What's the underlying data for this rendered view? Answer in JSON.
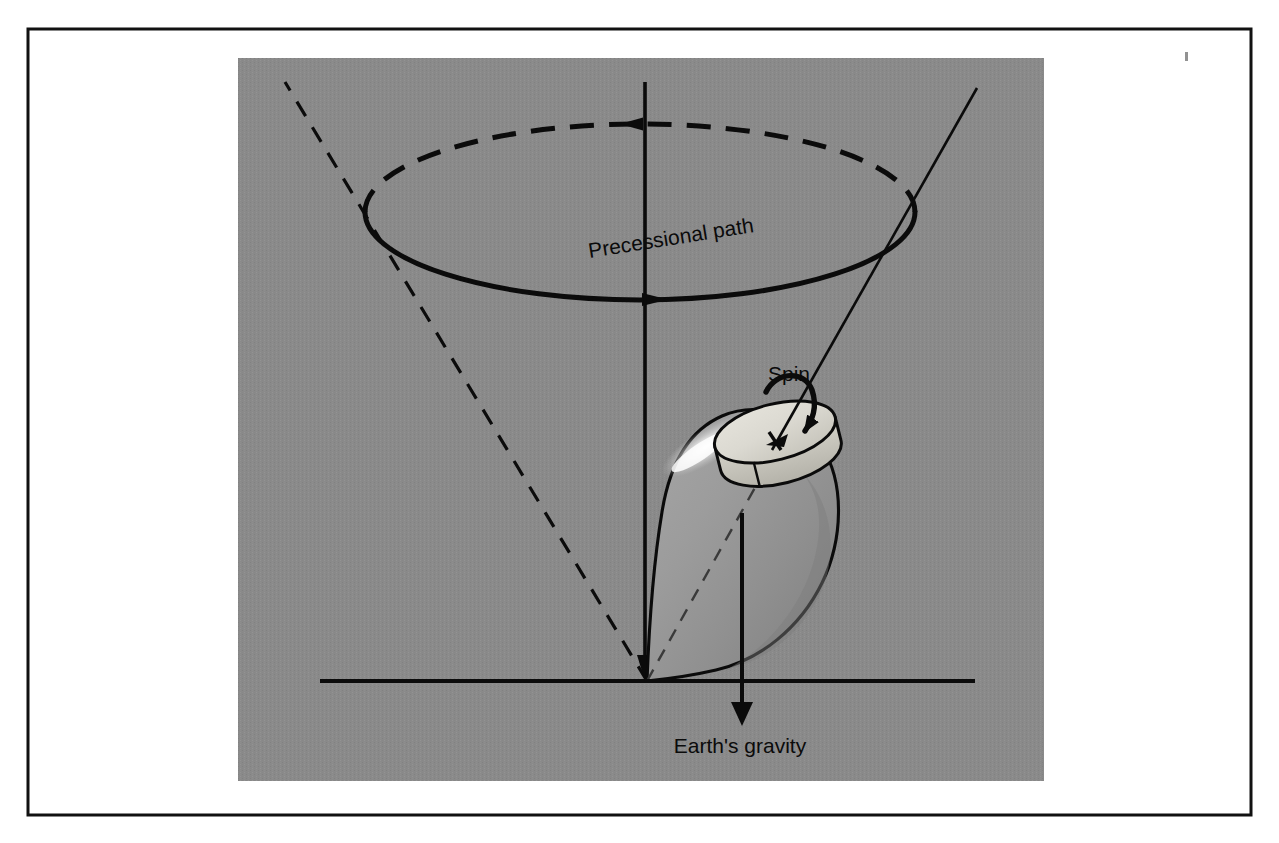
{
  "figure": {
    "domain": "Diagram",
    "background_color": "#ffffff",
    "panel_color": "#8a8a8a",
    "panel_texture_color": "#828282",
    "frame_color": "#111111",
    "ink_color": "#0b0b0b",
    "top_body_color": "#9a9a9a",
    "top_body_shadow_color": "#7f7f7f",
    "top_highlight_color": "#f2f2f2",
    "disk_face_color": "#d9d7cf",
    "disk_rim_color": "#c3c1b8"
  },
  "frame": {
    "x": 28,
    "y": 29,
    "width": 1223,
    "height": 786,
    "stroke_width": 3
  },
  "panel": {
    "x": 238,
    "y": 58,
    "width": 806,
    "height": 723
  },
  "labels": [
    {
      "name": "precessional-path-label",
      "text": "Precessional path",
      "x": 672,
      "y": 245,
      "font_size": 21,
      "rotation": -9,
      "anchor": "middle"
    },
    {
      "name": "spin-label",
      "text": "Spin",
      "x": 789,
      "y": 381,
      "font_size": 21,
      "rotation": 0,
      "anchor": "middle"
    },
    {
      "name": "earths-gravity-label",
      "text": "Earth's gravity",
      "x": 740,
      "y": 753,
      "font_size": 21,
      "rotation": 0,
      "anchor": "middle"
    }
  ],
  "geometry": {
    "pivot": {
      "x": 647,
      "y": 681
    },
    "vertical_axis": {
      "x": 645,
      "y_top": 82,
      "y_bottom": 681
    },
    "ground_line": {
      "x_start": 320,
      "x_end": 975,
      "y": 681
    },
    "precession_ellipse": {
      "cx": 640,
      "cy": 212,
      "rx": 275,
      "ry": 88,
      "front_arc_style": "solid",
      "back_arc_style": "dashed",
      "front_arrow_direction": "right",
      "front_arrow_x": 648,
      "back_arrow_direction": "left",
      "back_arrow_x": 636
    },
    "cone_line_left": {
      "x1": 647,
      "y1": 681,
      "x2": 285,
      "y2": 82,
      "style": "dashed"
    },
    "spin_axis": {
      "x1": 647,
      "y1": 681,
      "x2": 977,
      "y2": 88,
      "style": "solid-upper-dashed-lower"
    },
    "gravity_arrow": {
      "x": 742,
      "y_start": 513,
      "y_end": 722,
      "direction": "down"
    },
    "disk": {
      "cx": 775,
      "cy": 432,
      "rx": 62,
      "ry": 28,
      "thickness": 24,
      "rotation": -14
    },
    "spin_curl_arrow": {
      "cx": 793,
      "cy": 400,
      "direction": "clockwise"
    }
  },
  "annotations": {
    "speck": {
      "x": 1185,
      "y": 52,
      "width": 3,
      "height": 9
    }
  }
}
